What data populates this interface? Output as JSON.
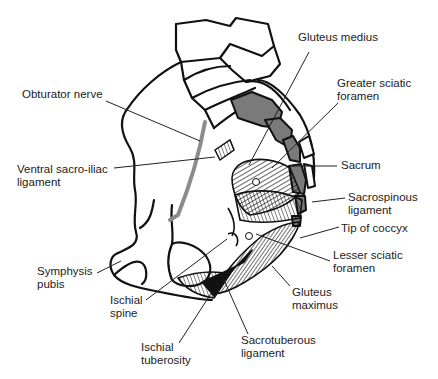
{
  "diagram": {
    "colors": {
      "outline": "#111111",
      "bone_fill": "#ffffff",
      "sacral_segment_fill": "#7a7a7a",
      "nerve": "#8c8c8c",
      "leader": "#222222",
      "text": "#222222"
    },
    "labels": [
      {
        "id": "obturator-nerve",
        "text": "Obturator nerve",
        "x": 22,
        "y": 88
      },
      {
        "id": "ventral-sacro-iliac-ligament",
        "text": "Ventral sacro-iliac\nligament",
        "x": 17,
        "y": 163
      },
      {
        "id": "symphysis-pubis",
        "text": "Symphysis\npubis",
        "x": 37,
        "y": 265
      },
      {
        "id": "ischial-spine",
        "text": "Ischial\nspine",
        "x": 110,
        "y": 294
      },
      {
        "id": "ischial-tuberosity",
        "text": "Ischial\ntuberosity",
        "x": 141,
        "y": 341
      },
      {
        "id": "gluteus-medius",
        "text": "Gluteus medius",
        "x": 298,
        "y": 31
      },
      {
        "id": "greater-sciatic-foramen",
        "text": "Greater sciatic\nforamen",
        "x": 337,
        "y": 77
      },
      {
        "id": "sacrum",
        "text": "Sacrum",
        "x": 341,
        "y": 159
      },
      {
        "id": "sacrospinous-ligament",
        "text": "Sacrospinous\nligament",
        "x": 348,
        "y": 191
      },
      {
        "id": "tip-of-coccyx",
        "text": "Tip of coccyx",
        "x": 341,
        "y": 222
      },
      {
        "id": "lesser-sciatic-foramen",
        "text": "Lesser sciatic\nforamen",
        "x": 333,
        "y": 249
      },
      {
        "id": "gluteus-maximus",
        "text": "Gluteus\nmaximus",
        "x": 292,
        "y": 286
      },
      {
        "id": "sacrotuberous-ligament",
        "text": "Sacrotuberous\nligament",
        "x": 241,
        "y": 334
      }
    ],
    "leaders": [
      {
        "for": "obturator-nerve",
        "points": [
          [
            106,
            101
          ],
          [
            200,
            141
          ]
        ]
      },
      {
        "for": "ventral-sacro-iliac-ligament",
        "points": [
          [
            114,
            168
          ],
          [
            215,
            157
          ]
        ]
      },
      {
        "for": "symphysis-pubis",
        "points": [
          [
            97,
            273
          ],
          [
            121,
            261
          ]
        ]
      },
      {
        "for": "ischial-spine",
        "points": [
          [
            146,
            300
          ],
          [
            227,
            239
          ]
        ]
      },
      {
        "for": "ischial-tuberosity",
        "points": [
          [
            179,
            343
          ],
          [
            212,
            292
          ]
        ]
      },
      {
        "for": "gluteus-medius",
        "points": [
          [
            309,
            52
          ],
          [
            249,
            165
          ]
        ]
      },
      {
        "for": "greater-sciatic-foramen",
        "points": [
          [
            338,
            103
          ],
          [
            272,
            168
          ]
        ]
      },
      {
        "for": "sacrum",
        "points": [
          [
            337,
            166
          ],
          [
            288,
            166
          ]
        ]
      },
      {
        "for": "sacrospinous-ligament",
        "points": [
          [
            345,
            198
          ],
          [
            312,
            202
          ]
        ]
      },
      {
        "for": "tip-of-coccyx",
        "points": [
          [
            339,
            227
          ],
          [
            300,
            238
          ]
        ]
      },
      {
        "for": "lesser-sciatic-foramen",
        "points": [
          [
            330,
            261
          ],
          [
            256,
            234
          ]
        ]
      },
      {
        "for": "gluteus-maximus",
        "points": [
          [
            290,
            286
          ],
          [
            272,
            266
          ]
        ]
      },
      {
        "for": "sacrotuberous-ligament",
        "points": [
          [
            248,
            334
          ],
          [
            224,
            280
          ]
        ]
      }
    ],
    "markers": [
      {
        "name": "greater-sciatic-foramen-dot",
        "cx": 256,
        "cy": 182,
        "r": 3.5
      },
      {
        "name": "lesser-sciatic-foramen-dot",
        "cx": 249,
        "cy": 236,
        "r": 3.5
      }
    ]
  }
}
